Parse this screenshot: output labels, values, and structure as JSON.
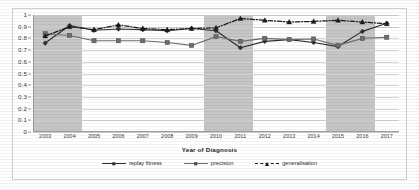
{
  "chart_data": {
    "type": "line",
    "title": "",
    "xlabel": "Year of Diagnosis",
    "ylabel": "",
    "ylim": [
      0,
      1
    ],
    "ytick_labels": [
      "0",
      "0.1",
      "0.2",
      "0.3",
      "0.4",
      "0.5",
      "0.6",
      "0.7",
      "0.8",
      "0.9",
      "1"
    ],
    "ytick_values": [
      0,
      0.1,
      0.2,
      0.3,
      0.4,
      0.5,
      0.6,
      0.7,
      0.8,
      0.9,
      1
    ],
    "grid": true,
    "legend_position": "bottom",
    "categories": [
      "2003",
      "2004",
      "2005",
      "2006",
      "2007",
      "2008",
      "2009",
      "2010",
      "2011",
      "2012",
      "2013",
      "2014",
      "2015",
      "2016",
      "2017"
    ],
    "series": [
      {
        "name": "replay fitness",
        "marker": "diamond",
        "linestyle": "solid",
        "color": "#2d2d2d",
        "values": [
          0.76,
          0.91,
          0.87,
          0.88,
          0.875,
          0.865,
          0.885,
          0.865,
          0.72,
          0.775,
          0.79,
          0.765,
          0.73,
          0.86,
          0.93
        ]
      },
      {
        "name": "precision",
        "marker": "square",
        "linestyle": "solid",
        "color": "#6e6e6e",
        "values": [
          0.84,
          0.825,
          0.78,
          0.78,
          0.78,
          0.765,
          0.74,
          0.815,
          0.775,
          0.8,
          0.79,
          0.795,
          0.74,
          0.8,
          0.81
        ]
      },
      {
        "name": "generalisation",
        "marker": "triangle",
        "linestyle": "dashdot",
        "color": "#1a1a1a",
        "values": [
          0.82,
          0.9,
          0.875,
          0.915,
          0.885,
          0.875,
          0.885,
          0.89,
          0.97,
          0.955,
          0.94,
          0.945,
          0.955,
          0.94,
          0.925
        ]
      }
    ],
    "shaded_bands": [
      {
        "from": "2003",
        "to": "2004"
      },
      {
        "from": "2010",
        "to": "2011"
      },
      {
        "from": "2015",
        "to": "2016"
      }
    ],
    "band_color": "#b0b0b0"
  }
}
